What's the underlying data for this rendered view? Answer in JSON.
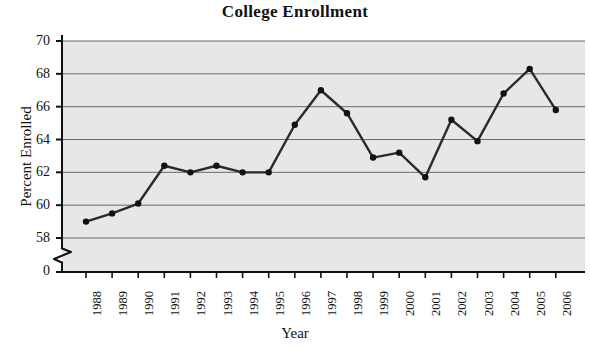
{
  "chart_data": {
    "type": "line",
    "title": "College Enrollment",
    "xlabel": "Year",
    "ylabel": "Percent Enrolled",
    "categories": [
      "1988",
      "1989",
      "1990",
      "1991",
      "1992",
      "1993",
      "1994",
      "1995",
      "1996",
      "1997",
      "1998",
      "1999",
      "2000",
      "2001",
      "2002",
      "2003",
      "2004",
      "2005",
      "2006"
    ],
    "values": [
      59.0,
      59.5,
      60.1,
      62.4,
      62.0,
      62.4,
      62.0,
      62.0,
      64.9,
      67.0,
      65.6,
      62.9,
      63.2,
      61.7,
      65.2,
      63.9,
      66.8,
      68.3,
      65.8
    ],
    "ylim": [
      58,
      70
    ],
    "yticks": [
      58,
      60,
      62,
      64,
      66,
      68,
      70
    ],
    "ytick_labels": [
      "58",
      "60",
      "62",
      "64",
      "66",
      "68",
      "70"
    ],
    "y_origin_label": "0",
    "axis_break": true,
    "grid": "horizontal",
    "legend": "none",
    "marker": "circle",
    "line_color": "#2b2b2b",
    "marker_color": "#111111",
    "plot_background": "#e7e7e7",
    "grid_color": "#6b6b6b"
  },
  "figure": {
    "background": "#ffffff"
  }
}
